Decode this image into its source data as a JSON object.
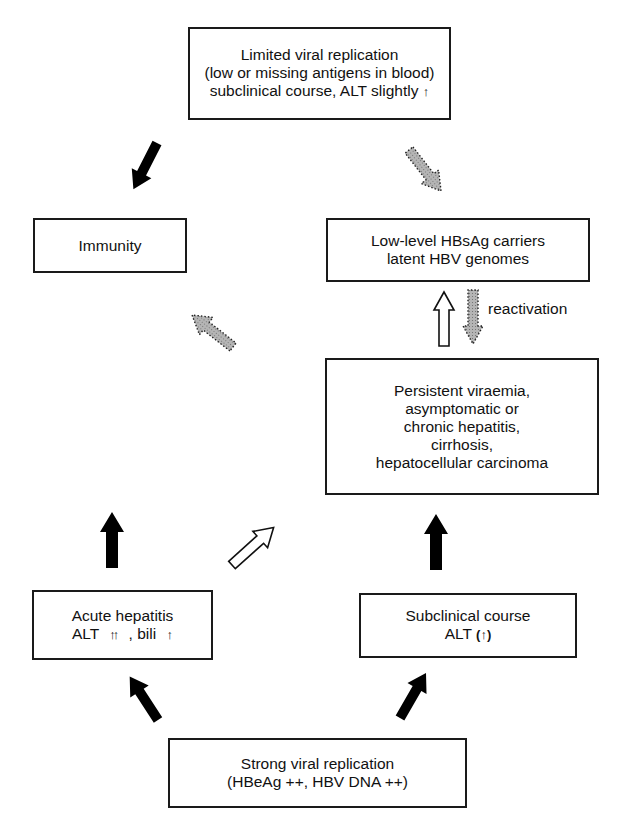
{
  "diagram": {
    "type": "flow-cycle",
    "topic": "Course of HBV infection",
    "nodes": {
      "limited": {
        "lines": [
          "Limited viral replication",
          "(low or missing antigens in blood)",
          "subclinical course, ALT slightly"
        ],
        "suffix_glyph": "↑"
      },
      "immunity": {
        "lines": [
          "Immunity"
        ]
      },
      "low_level": {
        "lines": [
          "Low-level HBsAg carriers",
          "latent HBV genomes"
        ]
      },
      "persistent": {
        "lines": [
          "Persistent viraemia,",
          "asymptomatic or",
          "chronic hepatitis,",
          "cirrhosis,",
          "hepatocellular carcinoma"
        ]
      },
      "acute": {
        "line1": "Acute hepatitis",
        "line2_a": "ALT",
        "line2_glyph1": "↑↑",
        "line2_b": ", bili",
        "line2_glyph2": "↑"
      },
      "subclinical": {
        "line1": "Subclinical course",
        "line2_a": "ALT",
        "line2_glyph": "(↑)"
      },
      "strong": {
        "lines": [
          "Strong viral replication",
          "(HBeAg ++, HBV DNA ++)"
        ]
      }
    },
    "edge_labels": {
      "reactivation": "reactivation"
    },
    "edges": [
      {
        "from": "limited",
        "to": "immunity",
        "style": "solid-black"
      },
      {
        "from": "limited",
        "to": "low_level",
        "style": "dotted-gray"
      },
      {
        "from": "persistent",
        "to": "low_level",
        "style": "open-white"
      },
      {
        "from": "low_level",
        "to": "persistent",
        "style": "dotted-gray",
        "label": "reactivation"
      },
      {
        "from": "center",
        "to": "immunity",
        "style": "dotted-gray"
      },
      {
        "from": "acute",
        "to": "limited",
        "style": "solid-black"
      },
      {
        "from": "acute",
        "to": "persistent",
        "style": "open-white"
      },
      {
        "from": "subclinical",
        "to": "persistent",
        "style": "solid-black"
      },
      {
        "from": "strong",
        "to": "acute",
        "style": "solid-black"
      },
      {
        "from": "strong",
        "to": "subclinical",
        "style": "solid-black"
      }
    ],
    "colors": {
      "border": "#1a1a1a",
      "solid_arrow": "#000000",
      "dotted_arrow_fill": "#a8a8a8",
      "open_arrow_fill": "#ffffff"
    }
  }
}
